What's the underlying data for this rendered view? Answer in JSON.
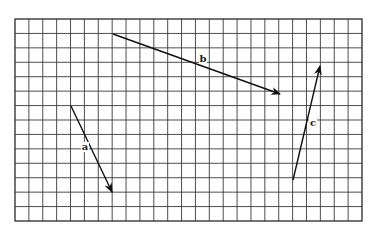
{
  "diagram": {
    "type": "vector-grid",
    "grid": {
      "left": 15,
      "top": 19,
      "right": 362,
      "bottom": 221,
      "columns": 25,
      "rows": 14,
      "line_color": "#3a3a3a",
      "border_color": "#2a2a2a"
    },
    "vectors": [
      {
        "name": "a",
        "label": "a",
        "from": [
          71,
          106
        ],
        "to": [
          112,
          192
        ],
        "label_pos": [
          85,
          150
        ]
      },
      {
        "name": "b",
        "label": "b",
        "from": [
          113,
          34
        ],
        "to": [
          280,
          94
        ],
        "label_pos": [
          203,
          62
        ]
      },
      {
        "name": "c",
        "label": "c",
        "from": [
          293,
          180
        ],
        "to": [
          320,
          66
        ],
        "label_pos": [
          313,
          126
        ]
      }
    ],
    "vector_color": "#111111"
  }
}
